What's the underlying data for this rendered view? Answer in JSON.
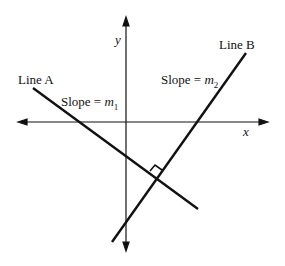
{
  "diagram": {
    "axes": {
      "x_label": "x",
      "y_label": "y"
    },
    "line_a": {
      "label": "Line A",
      "slope_text": "Slope = ",
      "slope_var": "m",
      "slope_sub": "1"
    },
    "line_b": {
      "label": "Line B",
      "slope_text": "Slope = ",
      "slope_var": "m",
      "slope_sub": "2"
    },
    "right_angle_marker": true,
    "colors": {
      "stroke": "#111111",
      "background": "#ffffff"
    }
  }
}
